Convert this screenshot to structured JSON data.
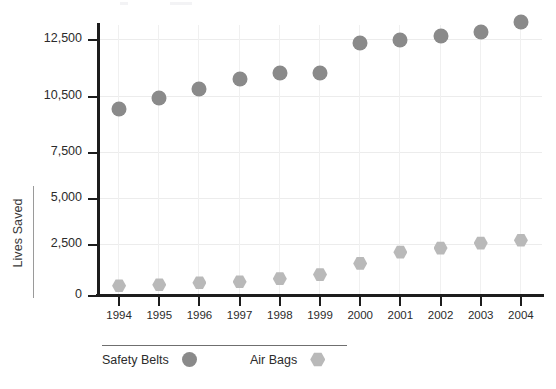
{
  "chart_data": {
    "type": "scatter",
    "title": "",
    "xlabel": "",
    "ylabel": "Lives Saved",
    "categories": [
      "1994",
      "1995",
      "1996",
      "1997",
      "1998",
      "1999",
      "2000",
      "2001",
      "2002",
      "2003",
      "2004"
    ],
    "ytick_labels": [
      "12,500",
      "10,500",
      "7,500",
      "5,000",
      "2,500",
      "0"
    ],
    "ytick_values": [
      12500,
      10500,
      7500,
      5000,
      2500,
      0
    ],
    "ylim": [
      0,
      13500
    ],
    "grid": true,
    "legend_position": "bottom-left",
    "series": [
      {
        "name": "Safety Belts",
        "marker": "circle",
        "color": "#8a8a8a",
        "values": [
          9800,
          10400,
          10750,
          11100,
          11300,
          11300,
          12350,
          12450,
          12600,
          12750,
          13100
        ]
      },
      {
        "name": "Air Bags",
        "marker": "hexagon",
        "color": "#b9b9b9",
        "values": [
          450,
          500,
          600,
          650,
          800,
          1000,
          1550,
          2100,
          2300,
          2550,
          2700
        ]
      }
    ]
  },
  "axes": {
    "axis_color": "#1d1d1d",
    "grid_color": "#ececec"
  }
}
